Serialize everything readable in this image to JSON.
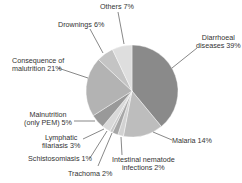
{
  "chart_data": {
    "type": "pie",
    "title": "",
    "start_angle_deg": 0,
    "direction": "clockwise",
    "slices": [
      {
        "label": "Diarrhoeal diseases",
        "value": 39,
        "color": "#8a8a8a"
      },
      {
        "label": "Malaria",
        "value": 14,
        "color": "#bdbdbd"
      },
      {
        "label": "Intestinal nematode infections",
        "value": 2,
        "color": "#d2d2d2"
      },
      {
        "label": "Trachoma",
        "value": 2,
        "color": "#a6a6a6"
      },
      {
        "label": "Schistosomiasis",
        "value": 1,
        "color": "#c8c8c8"
      },
      {
        "label": "Lymphatic filariasis",
        "value": 3,
        "color": "#d9d9d9"
      },
      {
        "label": "Malnutrition (only PEM)",
        "value": 5,
        "color": "#999999"
      },
      {
        "label": "Consequence of malutrition",
        "value": 21,
        "color": "#b3b3b3"
      },
      {
        "label": "Drownings",
        "value": 6,
        "color": "#c4c4c4"
      },
      {
        "label": "Others",
        "value": 7,
        "color": "#dedede"
      }
    ]
  },
  "labels": {
    "others": "Others 7%",
    "drownings": "Drownings 6%",
    "diarrhoeal_1": "Diarrhoeal",
    "diarrhoeal_2": "diseases 39%",
    "consequence_1": "Consequence of",
    "consequence_2": "malutrition 21%",
    "malnutrition_1": "Malnutrition",
    "malnutrition_2": "(only PEM) 5%",
    "lymphatic_1": "Lymphatic",
    "lymphatic_2": "filariasis 3%",
    "schisto": "Schistosomiasis 1%",
    "trachoma": "Trachoma 2%",
    "intestinal_1": "Intestinal nematode",
    "intestinal_2": "infections 2%",
    "malaria": "Malaria 14%"
  }
}
